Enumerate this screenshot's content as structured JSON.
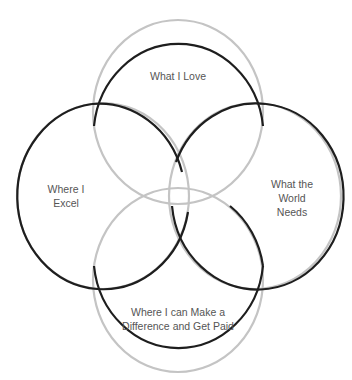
{
  "diagram": {
    "type": "venn",
    "stroke_color_dark": "#1e1e1e",
    "stroke_color_light": "#bdbdbd",
    "circles": [
      {
        "id": "top",
        "label": "What I Love",
        "cx": 178,
        "cy": 112,
        "rx": 85,
        "ry": 92
      },
      {
        "id": "left",
        "label_line1": "Where I",
        "label_line2": "Excel",
        "cx": 103,
        "cy": 196,
        "rx": 86,
        "ry": 93
      },
      {
        "id": "right",
        "label_line1": "What the",
        "label_line2": "World",
        "label_line3": "Needs",
        "cx": 255,
        "cy": 196,
        "rx": 86,
        "ry": 93
      },
      {
        "id": "bottom",
        "label_line1": "Where I can Make a",
        "label_line2": "Difference and Get Paid",
        "cx": 178,
        "cy": 280,
        "rx": 85,
        "ry": 92
      }
    ]
  }
}
